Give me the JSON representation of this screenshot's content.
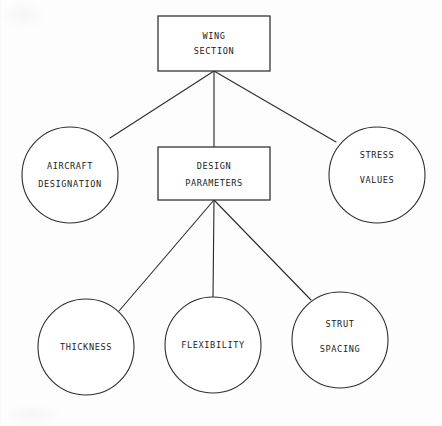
{
  "diagram": {
    "type": "hierarchy-tree",
    "title_node": "wing-section",
    "background_color": "#fdfdfd",
    "line_color": "#2e2e2e",
    "nodes": [
      {
        "id": "wing-section",
        "shape": "rectangle",
        "lines": [
          "WING",
          "SECTION"
        ],
        "level": 0,
        "x": 158,
        "y": 16,
        "width": 112,
        "height": 55
      },
      {
        "id": "aircraft-designation",
        "shape": "circle",
        "lines": [
          "AIRCRAFT",
          "DESIGNATION"
        ],
        "level": 1,
        "cx": 70,
        "cy": 175,
        "r": 48
      },
      {
        "id": "design-parameters",
        "shape": "rectangle",
        "lines": [
          "DESIGN",
          "PARAMETERS"
        ],
        "level": 1,
        "x": 158,
        "y": 147,
        "width": 112,
        "height": 53
      },
      {
        "id": "stress-values",
        "shape": "circle",
        "lines": [
          "STRESS",
          "VALUES"
        ],
        "level": 1,
        "cx": 377,
        "cy": 175,
        "r": 48
      },
      {
        "id": "thickness",
        "shape": "circle",
        "lines": [
          "THICKNESS"
        ],
        "level": 2,
        "cx": 86,
        "cy": 347,
        "r": 48
      },
      {
        "id": "flexibility",
        "shape": "circle",
        "lines": [
          "FLEXIBILITY"
        ],
        "level": 2,
        "cx": 213,
        "cy": 345,
        "r": 48
      },
      {
        "id": "strut-spacing",
        "shape": "circle",
        "lines": [
          "STRUT",
          "SPACING"
        ],
        "level": 2,
        "cx": 340,
        "cy": 340,
        "r": 48
      }
    ],
    "edges": [
      {
        "id": "edge-wing-to-aircraft",
        "from": "wing-section",
        "to": "aircraft-designation",
        "path": "M 214 71 L 110 138"
      },
      {
        "id": "edge-wing-to-design",
        "from": "wing-section",
        "to": "design-parameters",
        "path": "M 214 71 L 214 147"
      },
      {
        "id": "edge-wing-to-stress",
        "from": "wing-section",
        "to": "stress-values",
        "path": "M 214 71 L 336 142"
      },
      {
        "id": "edge-design-to-thickness",
        "from": "design-parameters",
        "to": "thickness",
        "path": "M 214 200 L 119 311"
      },
      {
        "id": "edge-design-to-flexibility",
        "from": "design-parameters",
        "to": "flexibility",
        "path": "M 214 200 L 213 297"
      },
      {
        "id": "edge-design-to-strut",
        "from": "design-parameters",
        "to": "strut-spacing",
        "path": "M 214 200 L 311 300"
      }
    ]
  }
}
